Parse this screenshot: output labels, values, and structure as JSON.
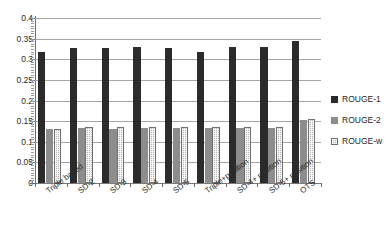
{
  "chart_data": {
    "type": "bar",
    "title": "",
    "xlabel": "",
    "ylabel": "",
    "ylim": [
      0,
      0.4
    ],
    "ytick_step": 0.05,
    "grid": true,
    "legend_position": "right",
    "categories": [
      "Triple based",
      "SD-2",
      "SD-3",
      "SD-4",
      "SD-5",
      "Triple+position",
      "SD-4+ position",
      "SD-5+ position",
      "OTS"
    ],
    "ytick_labels": [
      "0",
      "0.05",
      "0.1",
      "0.15",
      "0.2",
      "0.25",
      "0.3",
      "0.35",
      "0.4"
    ],
    "series": [
      {
        "name": "ROUGE-1",
        "color": "#2b2b2b",
        "values": [
          0.318,
          0.327,
          0.327,
          0.329,
          0.327,
          0.318,
          0.33,
          0.329,
          0.345
        ]
      },
      {
        "name": "ROUGE-2",
        "color": "#8d8d8d",
        "values": [
          0.131,
          0.133,
          0.131,
          0.133,
          0.133,
          0.133,
          0.134,
          0.134,
          0.152
        ]
      },
      {
        "name": "ROUGE-w",
        "color": "#b4b4b4",
        "values": [
          0.131,
          0.136,
          0.136,
          0.137,
          0.136,
          0.136,
          0.137,
          0.137,
          0.155
        ]
      }
    ]
  }
}
